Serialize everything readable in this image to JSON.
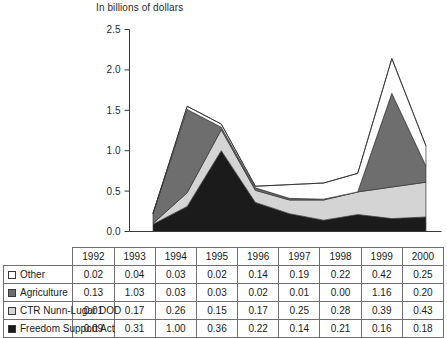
{
  "chart_data": {
    "type": "area",
    "stacked": true,
    "title": "In billions of dollars",
    "xlabel": "",
    "ylabel": "",
    "ylim": [
      0.0,
      2.5
    ],
    "ytick_labels": [
      "0.0",
      "0.5",
      "1.0",
      "1.5",
      "2.0",
      "2.5"
    ],
    "ytick_values": [
      0.0,
      0.5,
      1.0,
      1.5,
      2.0,
      2.5
    ],
    "grid": false,
    "legend_position": "table-row-headers",
    "categories": [
      "1992",
      "1993",
      "1994",
      "1995",
      "1996",
      "1997",
      "1998",
      "1999",
      "2000"
    ],
    "series": [
      {
        "name": "Other",
        "order_from_top": 1,
        "color": "#ffffff",
        "values": [
          0.02,
          0.04,
          0.03,
          0.02,
          0.14,
          0.19,
          0.22,
          0.42,
          0.25
        ]
      },
      {
        "name": "Agriculture",
        "order_from_top": 2,
        "color": "#6e6e6e",
        "values": [
          0.13,
          1.03,
          0.03,
          0.03,
          0.02,
          0.01,
          0.0,
          1.16,
          0.2
        ]
      },
      {
        "name": "CTR Nunn-Lugar DOD",
        "order_from_top": 3,
        "color": "#d4d4d4",
        "values": [
          0.01,
          0.17,
          0.26,
          0.15,
          0.17,
          0.25,
          0.28,
          0.39,
          0.43
        ]
      },
      {
        "name": "Freedom Support Act",
        "order_from_top": 4,
        "color": "#1b1b1b",
        "values": [
          0.09,
          0.31,
          1.0,
          0.36,
          0.22,
          0.14,
          0.21,
          0.16,
          0.18
        ]
      }
    ],
    "outline_totals": [
      0.22,
      1.55,
      1.33,
      0.56,
      0.58,
      0.6,
      0.72,
      2.14,
      1.06
    ]
  },
  "table": {
    "corner_label": "",
    "year_headers": [
      "1992",
      "1993",
      "1994",
      "1995",
      "1996",
      "1997",
      "1998",
      "1999",
      "2000"
    ],
    "rows": [
      {
        "label": "Other",
        "swatch": "swatch-white",
        "values": [
          "0.02",
          "0.04",
          "0.03",
          "0.02",
          "0.14",
          "0.19",
          "0.22",
          "0.42",
          "0.25"
        ]
      },
      {
        "label": "Agriculture",
        "swatch": "swatch-darkgray",
        "values": [
          "0.13",
          "1.03",
          "0.03",
          "0.03",
          "0.02",
          "0.01",
          "0.00",
          "1.16",
          "0.20"
        ]
      },
      {
        "label": "CTR Nunn-Lugar DOD",
        "swatch": "swatch-lightgray",
        "values": [
          "0.01",
          "0.17",
          "0.26",
          "0.15",
          "0.17",
          "0.25",
          "0.28",
          "0.39",
          "0.43"
        ]
      },
      {
        "label": "Freedom Support Act",
        "swatch": "swatch-black",
        "values": [
          "0.09",
          "0.31",
          "1.00",
          "0.36",
          "0.22",
          "0.14",
          "0.21",
          "0.16",
          "0.18"
        ]
      }
    ]
  },
  "colors": {
    "other": "#ffffff",
    "agriculture": "#6e6e6e",
    "ctr_nunn_lugar_dod": "#d4d4d4",
    "freedom_support_act": "#1b1b1b",
    "axis": "#3a3a3a",
    "grid_border": "#6f6f6f"
  }
}
